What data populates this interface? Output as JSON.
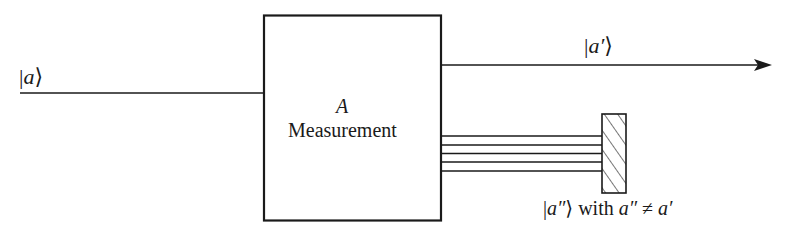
{
  "diagram": {
    "type": "measurement-filter-schematic",
    "input_state": {
      "bar": "|",
      "symbol": "a",
      "close": "⟩"
    },
    "device": {
      "operator": "A",
      "label": "Measurement"
    },
    "output_state": {
      "bar": "|",
      "symbol": "a′",
      "close": "⟩"
    },
    "rejected_states": {
      "bar": "|",
      "symbol": "a″",
      "close": "⟩",
      "condition_word": "with",
      "condition_lhs": "a″",
      "condition_op": "≠",
      "condition_rhs": "a′"
    },
    "rejected_beam_count": 5,
    "colors": {
      "stroke": "#1a1a1a",
      "background": "#ffffff"
    }
  }
}
